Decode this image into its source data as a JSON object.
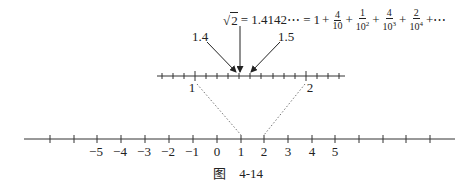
{
  "formula": {
    "sqrt_arg": "2",
    "lhs_value": "= 1.4142⋯ =",
    "one": "1",
    "plus": "+",
    "terms": [
      {
        "num": "4",
        "den": "10",
        "exp": ""
      },
      {
        "num": "1",
        "den": "10",
        "exp": "2"
      },
      {
        "num": "4",
        "den": "10",
        "exp": "3"
      },
      {
        "num": "2",
        "den": "10",
        "exp": "4"
      }
    ],
    "trail": "+⋯"
  },
  "arrows": {
    "left_label": "1.4",
    "right_label": "1.5"
  },
  "zoom_axis": {
    "label_left": "1",
    "label_right": "2"
  },
  "main_axis": {
    "labels": [
      "−5",
      "−4",
      "−3",
      "−2",
      "−1",
      "0",
      "1",
      "2",
      "3",
      "4",
      "5"
    ]
  },
  "caption": {
    "prefix": "图",
    "number": "4-14"
  }
}
